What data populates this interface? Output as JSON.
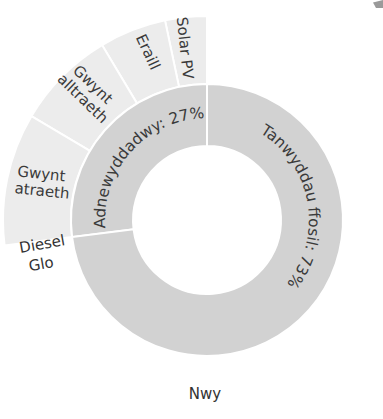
{
  "chart_data": {
    "type": "pie",
    "subtype": "nested-donut",
    "title": "",
    "colors": {
      "inner_ring": "#d2d2d2",
      "outer_ring": "#ececec",
      "separator": "#ffffff",
      "text": "#333333"
    },
    "inner_ring": [
      {
        "label": "Adnewyddadwy: 27%",
        "name": "Adnewyddadwy",
        "value": 27
      },
      {
        "label": "Tanwyddau ffosil: 73%",
        "name": "Tanwyddau ffosil",
        "value": 73
      }
    ],
    "outer_ring": [
      {
        "label": "Solar PV",
        "lines": [
          "Solar PV"
        ],
        "value": 3.3,
        "group": "Adnewyddadwy"
      },
      {
        "label": "Eraill",
        "lines": [
          "Eraill"
        ],
        "value": 5.3,
        "group": "Adnewyddadwy"
      },
      {
        "label": "Gwynt alltraeth",
        "lines": [
          "Gwynt",
          "alltraeth"
        ],
        "value": 7.9,
        "group": "Adnewyddadwy"
      },
      {
        "label": "Gwynt atraeth",
        "lines": [
          "Gwynt",
          "atraeth"
        ],
        "value": 10.5,
        "group": "Adnewyddadwy"
      },
      {
        "label": "Diesel",
        "lines": [
          "Diesel"
        ],
        "value": 0.5,
        "group": "Tanwyddau ffosil"
      },
      {
        "label": "Glo",
        "lines": [
          "Glo"
        ],
        "value": 0.5,
        "group": "Tanwyddau ffosil"
      },
      {
        "label": "Nwy",
        "lines": [
          "Nwy"
        ],
        "value": 72,
        "group": "Tanwyddau ffosil"
      }
    ],
    "legend": null
  }
}
